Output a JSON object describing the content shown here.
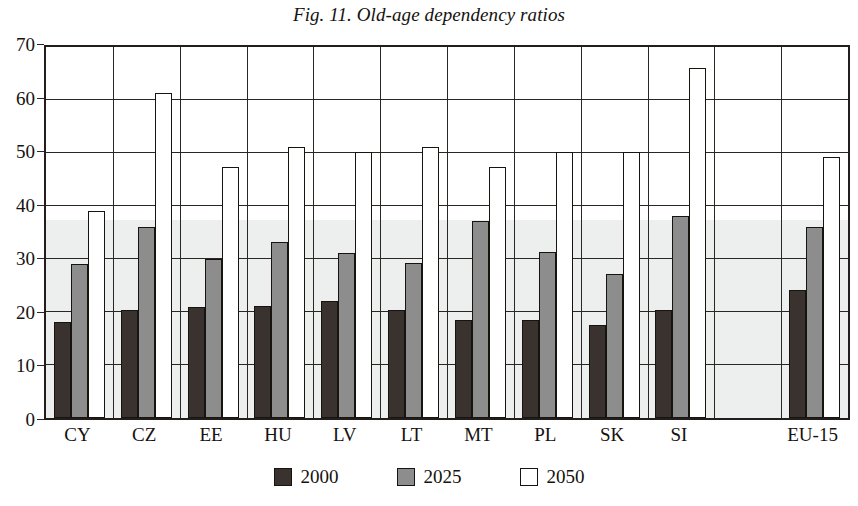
{
  "chart_data": {
    "type": "bar",
    "title": "Fig. 11. Old-age dependency ratios",
    "xlabel": "",
    "ylabel": "",
    "ylim": [
      0,
      70
    ],
    "yticks": [
      0,
      10,
      20,
      30,
      40,
      50,
      60,
      70
    ],
    "grid": true,
    "legend_position": "bottom-center",
    "categories": [
      "CY",
      "CZ",
      "EE",
      "HU",
      "LV",
      "LT",
      "MT",
      "PL",
      "SK",
      "SI",
      "",
      "EU-15"
    ],
    "series": [
      {
        "name": "2000",
        "color": "#3a322f",
        "values": [
          18.1,
          20.3,
          21.0,
          21.2,
          22.1,
          20.3,
          18.4,
          18.4,
          17.6,
          20.4,
          null,
          24.2
        ]
      },
      {
        "name": "2025",
        "color": "#8d8d8d",
        "values": [
          29.1,
          36.0,
          30.0,
          33.3,
          31.2,
          29.2,
          37.1,
          31.3,
          27.2,
          38.1,
          null,
          36.1
        ]
      },
      {
        "name": "2050",
        "color": "#ffffff",
        "values": [
          39.0,
          61.3,
          47.3,
          51.2,
          50.1,
          51.1,
          47.3,
          50.2,
          50.2,
          66.1,
          null,
          49.2
        ]
      }
    ]
  },
  "legend": {
    "items": [
      {
        "label": "2000",
        "swatch": "s2000"
      },
      {
        "label": "2025",
        "swatch": "s2025"
      },
      {
        "label": "2050",
        "swatch": "s2050"
      }
    ]
  }
}
